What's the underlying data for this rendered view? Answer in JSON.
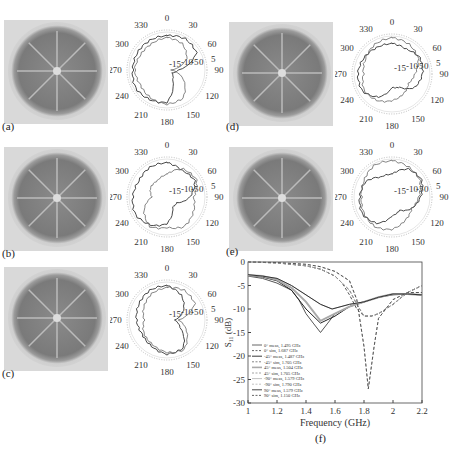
{
  "panels": [
    {
      "id": "a",
      "label": "(a)"
    },
    {
      "id": "b",
      "label": "(b)"
    },
    {
      "id": "c",
      "label": "(c)"
    },
    {
      "id": "d",
      "label": "(d)"
    },
    {
      "id": "e",
      "label": "(e)"
    },
    {
      "id": "f",
      "label": "(f)"
    }
  ],
  "polar": {
    "angle_labels": [
      "0",
      "30",
      "60",
      "90",
      "120",
      "150",
      "180",
      "210",
      "240",
      "270",
      "300",
      "330"
    ],
    "radial_labels": [
      "-15",
      "-10",
      "-5",
      "0",
      "5"
    ]
  },
  "chart_data": {
    "type": "line",
    "title": "",
    "xlabel": "Frequency (GHz)",
    "ylabel": "S11 (dB)",
    "xlim": [
      1,
      2.2
    ],
    "ylim": [
      -30,
      0
    ],
    "xticks": [
      "1",
      "1.2",
      "1.4",
      "1.6",
      "1.8",
      "2",
      "2.2"
    ],
    "yticks": [
      "0",
      "-5",
      "-10",
      "-15",
      "-20",
      "-25",
      "-30"
    ],
    "grid": false,
    "legend_position": "lower left",
    "series": [
      {
        "name": "0° meas, 1.495 GHz",
        "style": "solid",
        "x": [
          1,
          1.1,
          1.2,
          1.3,
          1.35,
          1.4,
          1.45,
          1.5,
          1.55,
          1.6,
          1.7,
          1.8,
          1.9,
          2,
          2.1,
          2.2
        ],
        "y": [
          -3,
          -3.5,
          -4.5,
          -6,
          -8,
          -11,
          -13,
          -15,
          -13,
          -11,
          -9.5,
          -8.5,
          -7.5,
          -7,
          -6.8,
          -7
        ]
      },
      {
        "name": "0° sim, 1.687 GHz",
        "style": "dashed",
        "x": [
          1,
          1.2,
          1.4,
          1.5,
          1.6,
          1.65,
          1.7,
          1.75,
          1.8,
          1.85,
          1.9,
          2,
          2.1,
          2.2
        ],
        "y": [
          0,
          -0.2,
          -0.8,
          -1.5,
          -3,
          -4.5,
          -7,
          -10,
          -11.5,
          -11.5,
          -11,
          -9,
          -6.5,
          -5
        ]
      },
      {
        "name": "-45° meas, 1.487 GHz",
        "style": "solid",
        "x": [
          1,
          1.1,
          1.2,
          1.3,
          1.4,
          1.5,
          1.6,
          1.7,
          1.8,
          1.9,
          2,
          2.1,
          2.2
        ],
        "y": [
          -2.8,
          -3.2,
          -4,
          -6,
          -10,
          -13,
          -11.5,
          -9.5,
          -8.5,
          -7.5,
          -6.8,
          -6.8,
          -7
        ]
      },
      {
        "name": "-45° sim, 1.705 GHz",
        "style": "dashed",
        "x": [
          1,
          1.2,
          1.4,
          1.5,
          1.6,
          1.7,
          1.75,
          1.8,
          1.85,
          1.9,
          2,
          2.1,
          2.2
        ],
        "y": [
          0,
          -0.2,
          -0.8,
          -1.5,
          -3,
          -6,
          -9,
          -11.5,
          -11.5,
          -11,
          -9,
          -6.5,
          -5
        ]
      },
      {
        "name": "45° meas, 1.504 GHz",
        "style": "solid",
        "x": [
          1,
          1.1,
          1.2,
          1.3,
          1.4,
          1.5,
          1.6,
          1.7,
          1.8,
          1.9,
          2,
          2.1,
          2.2
        ],
        "y": [
          -2.8,
          -3,
          -3.8,
          -5.5,
          -8.5,
          -12.5,
          -11,
          -9.5,
          -8.5,
          -7.5,
          -6.8,
          -6.8,
          -7
        ]
      },
      {
        "name": "45° sim, 1.705 GHz",
        "style": "dashed",
        "x": [
          1,
          1.2,
          1.4,
          1.5,
          1.6,
          1.7,
          1.75,
          1.8,
          1.85,
          1.9,
          2,
          2.1,
          2.2
        ],
        "y": [
          0,
          -0.2,
          -0.8,
          -1.5,
          -3,
          -6,
          -9,
          -11.5,
          -11.5,
          -11,
          -9,
          -6.5,
          -5
        ]
      },
      {
        "name": "-90° meas, 1.579 GHz",
        "style": "solid",
        "x": [
          1,
          1.1,
          1.2,
          1.3,
          1.4,
          1.5,
          1.58,
          1.7,
          1.8,
          1.9,
          2,
          2.1,
          2.2
        ],
        "y": [
          -2.7,
          -3,
          -3.5,
          -5,
          -7,
          -9,
          -10,
          -9,
          -8.5,
          -7.5,
          -6.8,
          -6.8,
          -7
        ]
      },
      {
        "name": "-90° sim, 1.790 GHz",
        "style": "dashed",
        "x": [
          1,
          1.2,
          1.4,
          1.5,
          1.6,
          1.7,
          1.75,
          1.8,
          1.83,
          1.87,
          1.9,
          2,
          2.1,
          2.2
        ],
        "y": [
          0,
          -0.1,
          -0.5,
          -1,
          -2,
          -4,
          -8,
          -18,
          -27,
          -18,
          -12,
          -8,
          -6.5,
          -6.5
        ]
      },
      {
        "name": "90° meas, 1.579 GHz",
        "style": "solid",
        "x": [
          1,
          1.1,
          1.2,
          1.3,
          1.4,
          1.5,
          1.58,
          1.7,
          1.8,
          1.9,
          2,
          2.1,
          2.2
        ],
        "y": [
          -2.7,
          -3,
          -3.5,
          -5,
          -7,
          -9,
          -10,
          -9,
          -8.5,
          -7.5,
          -6.8,
          -6.8,
          -7
        ]
      },
      {
        "name": "90° sim, 1.150 GHz",
        "style": "dashed",
        "x": [
          1,
          1.2,
          1.4,
          1.5,
          1.6,
          1.7,
          1.75,
          1.8,
          1.83,
          1.87,
          1.9,
          2,
          2.1,
          2.2
        ],
        "y": [
          0,
          -0.1,
          -0.5,
          -1,
          -2,
          -4,
          -8,
          -18,
          -27,
          -18,
          -12,
          -8,
          -6.5,
          -6.5
        ]
      }
    ]
  }
}
